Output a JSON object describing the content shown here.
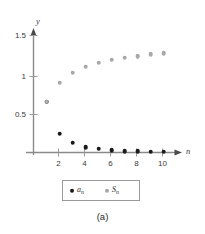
{
  "figure": {
    "caption": "(a)",
    "background_color": "#ffffff"
  },
  "legend": {
    "entries": [
      {
        "label": "a",
        "subscript": "n",
        "color": "#1a1a1a",
        "marker": "circle"
      },
      {
        "label": "S",
        "subscript": "n",
        "color": "#a8a8a8",
        "marker": "circle"
      }
    ]
  },
  "chart_data": {
    "type": "scatter",
    "title": "",
    "xlabel": "n",
    "ylabel": "y",
    "xlim": [
      0,
      11.2
    ],
    "ylim": [
      0,
      1.62
    ],
    "grid": false,
    "legend_position": "below-axes",
    "x": [
      1,
      2,
      3,
      4,
      5,
      6,
      7,
      8,
      9,
      10
    ],
    "xticks": [
      2,
      4,
      6,
      8,
      10
    ],
    "xticklabels": [
      "2",
      "4",
      "6",
      "8",
      "10"
    ],
    "yticks": [
      0.5,
      1,
      1.5
    ],
    "yticklabels": [
      "0.5",
      "1",
      "1.5"
    ],
    "series": [
      {
        "name": "a_n",
        "display_name": "aₙ",
        "color": "#1a1a1a",
        "values": [
          0.67,
          0.25,
          0.13,
          0.07,
          0.05,
          0.03,
          0.02,
          0.02,
          0.01,
          0.01
        ]
      },
      {
        "name": "S_n",
        "display_name": "Sₙ",
        "color": "#a8a8a8",
        "values": [
          0.67,
          0.92,
          1.05,
          1.13,
          1.18,
          1.22,
          1.25,
          1.27,
          1.29,
          1.31
        ]
      }
    ]
  }
}
